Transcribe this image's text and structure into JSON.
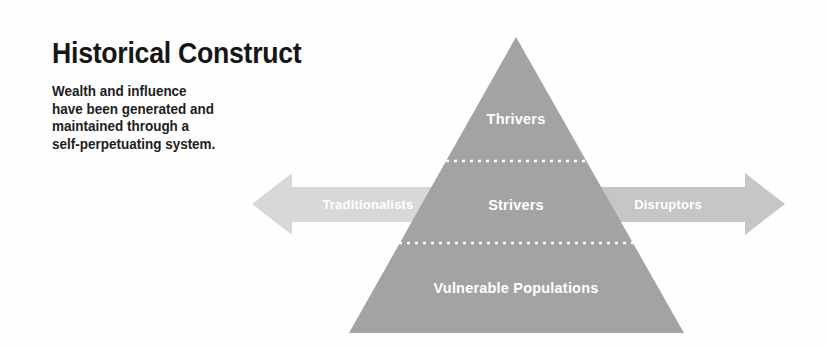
{
  "figure": {
    "title": "Historical Construct",
    "description_lines": [
      "Wealth and influence",
      "have been generated and",
      "maintained through a",
      "self-perpetuating system."
    ]
  },
  "pyramid": {
    "tiers": [
      {
        "id": "top",
        "label": "Thrivers"
      },
      {
        "id": "middle",
        "label": "Strivers"
      },
      {
        "id": "bottom",
        "label": "Vulnerable Populations"
      }
    ],
    "divider_style": "dotted-white"
  },
  "arrows": {
    "left": {
      "label": "Traditionalists",
      "direction": "left"
    },
    "right": {
      "label": "Disruptors",
      "direction": "right"
    }
  },
  "colors": {
    "background": "#fefefe",
    "pyramid_fill": "#a3a3a3",
    "left_arrow_fill": "#d8d8d8",
    "right_arrow_fill": "#c6c6c6",
    "divider": "#ffffff",
    "title_text": "#161616",
    "body_text": "#1d1d1d",
    "label_text": "#ffffff"
  }
}
